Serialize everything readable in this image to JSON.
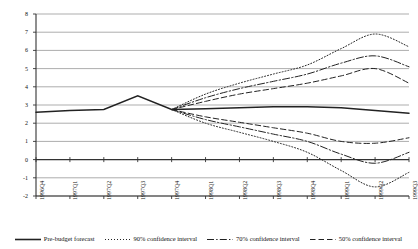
{
  "chart_data": {
    "type": "line",
    "title": "",
    "subtitle": "",
    "xlabel": "",
    "ylabel": "",
    "ylim": [
      -2,
      8
    ],
    "ytick_step": 1,
    "yticks": [
      8,
      7,
      6,
      5,
      4,
      3,
      2,
      1,
      0,
      -1,
      -2
    ],
    "grid": true,
    "grid_axis": "y",
    "legend_position": "bottom",
    "categories": [
      "1996Q4",
      "1997Q1",
      "1997Q2",
      "1997Q3",
      "1997Q4",
      "1998Q1",
      "1998Q2",
      "1998Q3",
      "1998Q4",
      "1999Q1",
      "1999Q2",
      "1999Q3"
    ],
    "series": [
      {
        "name": "Pre-budget forecast",
        "style": "solid",
        "color": "#222222",
        "values": [
          2.6,
          2.7,
          2.75,
          3.5,
          2.75,
          2.8,
          2.85,
          2.9,
          2.9,
          2.85,
          2.7,
          2.55
        ]
      },
      {
        "name": "90% confidence interval (upper)",
        "style": "dotted",
        "color": "#222222",
        "values": [
          null,
          null,
          null,
          null,
          2.75,
          3.6,
          4.2,
          4.7,
          5.2,
          6.1,
          6.9,
          6.2
        ]
      },
      {
        "name": "90% confidence interval (lower)",
        "style": "dotted",
        "color": "#222222",
        "values": [
          null,
          null,
          null,
          null,
          2.75,
          2.0,
          1.5,
          1.0,
          0.4,
          -0.6,
          -1.5,
          -0.7
        ]
      },
      {
        "name": "70% confidence interval (upper)",
        "style": "dashdot",
        "color": "#222222",
        "values": [
          null,
          null,
          null,
          null,
          2.75,
          3.4,
          3.9,
          4.3,
          4.7,
          5.3,
          5.7,
          5.1
        ]
      },
      {
        "name": "70% confidence interval (lower)",
        "style": "dashdot",
        "color": "#222222",
        "values": [
          null,
          null,
          null,
          null,
          2.75,
          2.2,
          1.8,
          1.4,
          1.0,
          0.3,
          -0.2,
          0.4
        ]
      },
      {
        "name": "50% confidence interval (upper)",
        "style": "dashed",
        "color": "#222222",
        "values": [
          null,
          null,
          null,
          null,
          2.75,
          3.2,
          3.6,
          3.9,
          4.2,
          4.6,
          5.0,
          4.2
        ]
      },
      {
        "name": "50% confidence interval (lower)",
        "style": "dashed",
        "color": "#222222",
        "values": [
          null,
          null,
          null,
          null,
          2.75,
          2.35,
          2.05,
          1.75,
          1.45,
          1.0,
          0.9,
          1.2
        ]
      }
    ]
  },
  "legend": {
    "items": [
      {
        "label": "Pre-budget forecast",
        "style": "solid"
      },
      {
        "label": "90% confidence interval",
        "style": "dotted"
      },
      {
        "label": "70% confidence interval",
        "style": "dashdot"
      },
      {
        "label": "50% confidence interval",
        "style": "dashed"
      }
    ]
  }
}
